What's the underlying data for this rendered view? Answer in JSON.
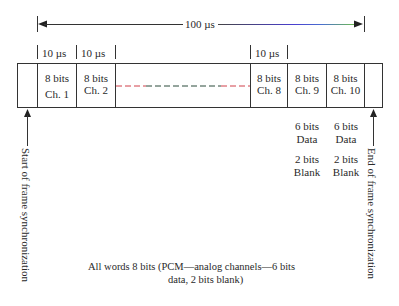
{
  "diagram": {
    "frame_duration_label": "100 µs",
    "slot_duration_label": "10 µs",
    "slot_duration_labels": [
      "10 µs",
      "10 µs",
      "10 µs"
    ],
    "channels": [
      {
        "bits": "8 bits",
        "name": "Ch. 1"
      },
      {
        "bits": "8 bits",
        "name": "Ch. 2"
      },
      {
        "bits": "8 bits",
        "name": "Ch. 8"
      },
      {
        "bits": "8 bits",
        "name": "Ch. 9"
      },
      {
        "bits": "8 bits",
        "name": "Ch. 10"
      }
    ],
    "analog_breakdown": [
      {
        "data": "6 bits",
        "data_label": "Data",
        "blank": "2 bits",
        "blank_label": "Blank"
      },
      {
        "data": "6 bits",
        "data_label": "Data",
        "blank": "2 bits",
        "blank_label": "Blank"
      }
    ],
    "start_label": "Start of frame synchronization",
    "end_label": "End of frame synchronization",
    "note_line1": "All words 8 bits  (PCM—analog channels—6 bits",
    "note_line2": "data, 2 bits blank)",
    "colors": {
      "line": "#333333",
      "dash_red": "#d0404a",
      "dash_green": "#2a4a3a",
      "arrow_blue": "#4a3fd0",
      "arrow_green": "#6fbf4a"
    }
  }
}
